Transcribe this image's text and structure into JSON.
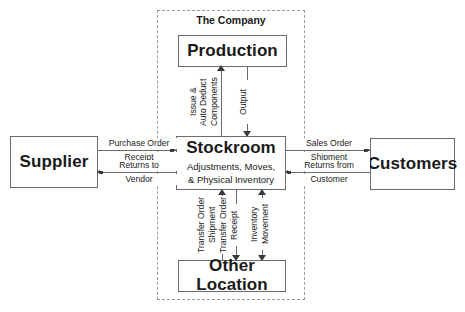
{
  "diagram": {
    "boundary_label": "The Company",
    "nodes": {
      "production": {
        "title": "Production"
      },
      "stockroom": {
        "title": "Stockroom",
        "sub_line1": "Adjustments, Moves,",
        "sub_line2": "& Physical Inventory"
      },
      "other_location": {
        "title": "Other Location"
      },
      "supplier": {
        "title": "Supplier"
      },
      "customers": {
        "title": "Customers"
      }
    },
    "flows": {
      "issue_auto_deduct": {
        "line1": "Issue &",
        "line2": "Auto Deduct",
        "line3": "Components",
        "direction": "up"
      },
      "output": {
        "line1": "Output",
        "direction": "down"
      },
      "purchase_order": {
        "line1": "Purchase Order",
        "line2": "Receipt",
        "direction": "right"
      },
      "returns_to_vendor": {
        "line1": "Returns to",
        "line2": "Vendor",
        "direction": "left"
      },
      "sales_order": {
        "line1": "Sales Order",
        "line2": "Shipment",
        "direction": "right"
      },
      "returns_from_customer": {
        "line1": "Returns from",
        "line2": "Customer",
        "direction": "left"
      },
      "transfer_order_shipment": {
        "line1": "Transfer Order",
        "line2": "Shipment",
        "direction": "down"
      },
      "transfer_order_receipt": {
        "line1": "Transfer Order",
        "line2": "Receipt",
        "direction": "up"
      },
      "inventory_movement": {
        "line1": "Inventory",
        "line2": "Movement",
        "direction": "both"
      }
    }
  },
  "colors": {
    "box_border": "#6b6b6b",
    "boundary_border": "#9a9a9a",
    "text": "#1a1a1a",
    "arrow": "#3a3a3a"
  }
}
